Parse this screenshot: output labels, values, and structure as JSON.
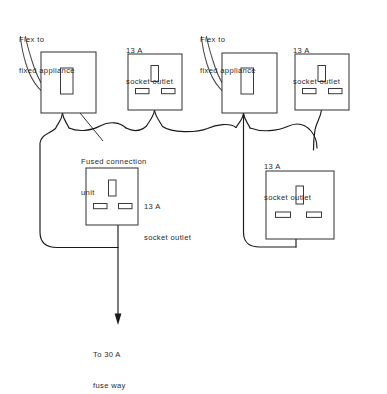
{
  "diagram": {
    "stroke_color": "#1a1a1a",
    "box_color": "#3a3a3a",
    "background": "#ffffff",
    "labels": {
      "flex_left_line1": "Flex to",
      "flex_left_line2": "fixed appliance",
      "socket_top_left_line1": "13 A",
      "socket_top_left_line2": "socket outlet",
      "flex_right_line1": "Flex to",
      "flex_right_line2": "fixed appliance",
      "socket_top_right_line1": "13 A",
      "socket_top_right_line2": "socket outlet",
      "fcu_line1": "Fused connection",
      "fcu_line2": "unit",
      "socket_middle_line1": "13 A",
      "socket_middle_line2": "socket outlet",
      "socket_right_line1": "13 A",
      "socket_right_line2": "socket outlet",
      "feed_line1": "To 30 A",
      "feed_line2": "fuse way"
    },
    "components": [
      {
        "name": "fused-connection-unit-left",
        "type": "fused connection unit",
        "rating": "13 A"
      },
      {
        "name": "socket-outlet-top-left",
        "type": "socket outlet",
        "rating": "13 A"
      },
      {
        "name": "fused-connection-unit-right",
        "type": "fused connection unit",
        "rating": "13 A"
      },
      {
        "name": "socket-outlet-top-right",
        "type": "socket outlet",
        "rating": "13 A"
      },
      {
        "name": "socket-outlet-middle",
        "type": "socket outlet",
        "rating": "13 A"
      },
      {
        "name": "socket-outlet-right",
        "type": "socket outlet",
        "rating": "13 A"
      }
    ],
    "supply": {
      "rating": "30 A",
      "destination": "fuse way"
    }
  }
}
